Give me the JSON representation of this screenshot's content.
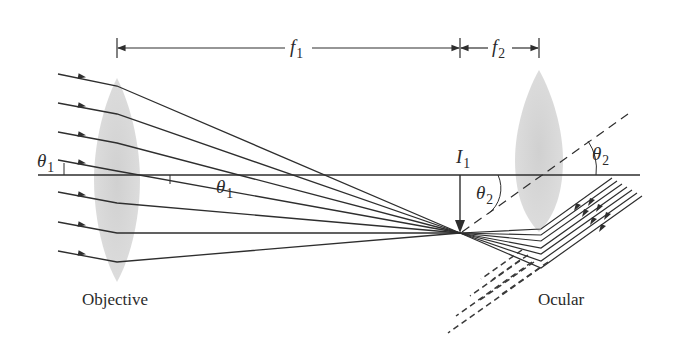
{
  "figure": {
    "colors": {
      "ink": "#2e2e2e",
      "lens_fill": "#cfcfcf",
      "background": "#ffffff"
    },
    "labels": {
      "f1": {
        "symbol": "f",
        "subscript": "1"
      },
      "f2": {
        "symbol": "f",
        "subscript": "2"
      },
      "theta1_left": {
        "symbol": "θ",
        "subscript": "1"
      },
      "theta1_mid": {
        "symbol": "θ",
        "subscript": "1"
      },
      "theta2_right": {
        "symbol": "θ",
        "subscript": "2"
      },
      "theta2_mid": {
        "symbol": "θ",
        "subscript": "2"
      },
      "image": {
        "symbol": "I",
        "subscript": "1"
      },
      "objective": "Objective",
      "ocular": "Ocular"
    },
    "elements": {
      "optical_axis": {
        "x1": 38,
        "x2": 640,
        "y": 175
      },
      "objective_lens": {
        "cx": 117,
        "top": 78,
        "bottom": 282,
        "half_width": 22
      },
      "ocular_lens": {
        "cx": 539,
        "top": 70,
        "bottom": 232,
        "half_width": 24
      },
      "focal_point": {
        "x": 460,
        "y": 233
      },
      "f1_span": {
        "x1": 117,
        "x2": 460,
        "y": 48
      },
      "f2_span": {
        "x1": 460,
        "x2": 539,
        "y": 48
      },
      "incoming_ray_count": 7,
      "outgoing_ray_count": 7
    }
  }
}
